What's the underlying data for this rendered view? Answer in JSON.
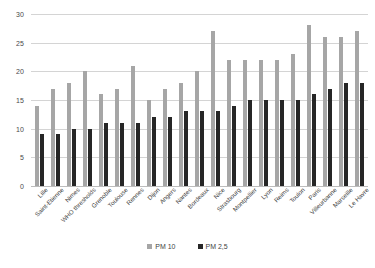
{
  "chart_data": {
    "type": "bar",
    "title": "",
    "subtitle": "",
    "xlabel": "",
    "ylabel": "",
    "ylim": [
      0,
      30
    ],
    "ytick_step": 5,
    "yticks": [
      0,
      5,
      10,
      15,
      20,
      25,
      30
    ],
    "grid": true,
    "legend_position": "bottom",
    "categories": [
      "Lille",
      "Saint-Etienne",
      "Nimes",
      "WHO thresholds",
      "Grenoble",
      "Toulouse",
      "Rennes",
      "Dijon",
      "Angers",
      "Nantes",
      "Bordeaux",
      "Nice",
      "Strasbourg",
      "Montpellier",
      "Lyon",
      "Reims",
      "Toulon",
      "Paris",
      "Villeurbanne",
      "Marseille",
      "Le Havre"
    ],
    "series": [
      {
        "name": "PM 10",
        "color": "#a6a6a6",
        "values": [
          14,
          17,
          18,
          20,
          16,
          17,
          21,
          15,
          17,
          18,
          20,
          27,
          22,
          22,
          22,
          22,
          23,
          28,
          26,
          26,
          27
        ]
      },
      {
        "name": "PM 2,5",
        "color": "#262626",
        "values": [
          9,
          9,
          10,
          10,
          11,
          11,
          11,
          12,
          12,
          13,
          13,
          13,
          14,
          15,
          15,
          15,
          15,
          16,
          17,
          18,
          18
        ]
      }
    ]
  },
  "legend": {
    "items": [
      {
        "label": "PM 10",
        "color": "#a6a6a6"
      },
      {
        "label": "PM 2,5",
        "color": "#262626"
      }
    ]
  },
  "colors": {
    "pm10": "#a6a6a6",
    "pm25": "#262626",
    "gridline": "#d4d4d4",
    "axis": "#bdbdbd",
    "text": "#404040",
    "background": "#ffffff"
  }
}
